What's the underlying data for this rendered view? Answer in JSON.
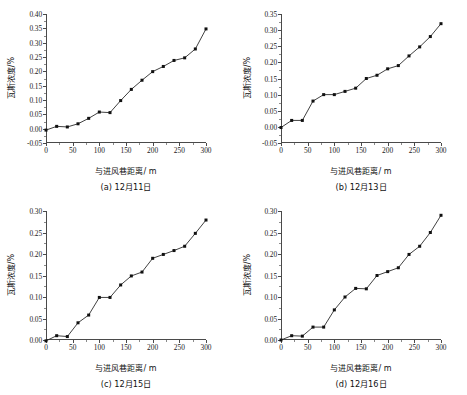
{
  "figure": {
    "background": "#ffffff",
    "marker_color": "#111111",
    "line_color": "#2b2b2b",
    "axis_color": "#4a4a4a",
    "layout": "2x2 grid of line charts"
  },
  "panels": [
    {
      "key": "a",
      "caption": "(a) 12月11日",
      "xlabel": "与进风巷距离/ m",
      "ylabel": "瓦斯浓度/%",
      "y_ticks": [
        "-0.05",
        "0.00",
        "0.05",
        "0.10",
        "0.15",
        "0.20",
        "0.25",
        "0.30",
        "0.35",
        "0.40"
      ],
      "x_ticks": [
        "0",
        "50",
        "100",
        "150",
        "200",
        "250",
        "300"
      ]
    },
    {
      "key": "b",
      "caption": "(b) 12月13日",
      "xlabel": "与进风巷距离/ m",
      "ylabel": "瓦斯浓度/%",
      "y_ticks": [
        "-0.05",
        "0.00",
        "0.05",
        "0.10",
        "0.15",
        "0.20",
        "0.25",
        "0.30",
        "0.35"
      ],
      "x_ticks": [
        "0",
        "50",
        "100",
        "150",
        "200",
        "250",
        "300"
      ]
    },
    {
      "key": "c",
      "caption": "(c) 12月15日",
      "xlabel": "与进风巷距离/ m",
      "ylabel": "瓦斯浓度/%",
      "y_ticks": [
        "0.00",
        "0.05",
        "0.10",
        "0.15",
        "0.20",
        "0.25",
        "0.30"
      ],
      "x_ticks": [
        "0",
        "50",
        "100",
        "150",
        "200",
        "250",
        "300"
      ]
    },
    {
      "key": "d",
      "caption": "(d) 12月16日",
      "xlabel": "与进风巷距离/ m",
      "ylabel": "瓦斯浓度/%",
      "y_ticks": [
        "0.00",
        "0.05",
        "0.10",
        "0.15",
        "0.20",
        "0.25",
        "0.30"
      ],
      "x_ticks": [
        "0",
        "50",
        "100",
        "150",
        "200",
        "250",
        "300"
      ]
    }
  ],
  "chart_data": [
    {
      "type": "line",
      "title": "(a) 12月11日",
      "xlabel": "与进风巷距离/ m",
      "ylabel": "瓦斯浓度/%",
      "xlim": [
        0,
        300
      ],
      "ylim": [
        -0.05,
        0.4
      ],
      "xticks": [
        0,
        50,
        100,
        150,
        200,
        250,
        300
      ],
      "yticks": [
        -0.05,
        0.0,
        0.05,
        0.1,
        0.15,
        0.2,
        0.25,
        0.3,
        0.35,
        0.4
      ],
      "grid": false,
      "legend": "none",
      "marker": "square",
      "x": [
        0,
        20,
        40,
        60,
        80,
        100,
        120,
        140,
        160,
        180,
        200,
        220,
        240,
        260,
        280,
        300
      ],
      "y": [
        -0.005,
        0.008,
        0.006,
        0.017,
        0.036,
        0.058,
        0.056,
        0.098,
        0.137,
        0.169,
        0.199,
        0.217,
        0.238,
        0.247,
        0.278,
        0.348
      ]
    },
    {
      "type": "line",
      "title": "(b) 12月13日",
      "xlabel": "与进风巷距离/ m",
      "ylabel": "瓦斯浓度/%",
      "xlim": [
        0,
        300
      ],
      "ylim": [
        -0.05,
        0.35
      ],
      "xticks": [
        0,
        50,
        100,
        150,
        200,
        250,
        300
      ],
      "yticks": [
        -0.05,
        0.0,
        0.05,
        0.1,
        0.15,
        0.2,
        0.25,
        0.3,
        0.35
      ],
      "grid": false,
      "legend": "none",
      "marker": "square",
      "x": [
        0,
        20,
        40,
        60,
        80,
        100,
        120,
        140,
        160,
        180,
        200,
        220,
        240,
        260,
        280,
        300
      ],
      "y": [
        -0.002,
        0.02,
        0.02,
        0.08,
        0.1,
        0.1,
        0.11,
        0.12,
        0.15,
        0.16,
        0.18,
        0.19,
        0.22,
        0.248,
        0.28,
        0.32
      ]
    },
    {
      "type": "line",
      "title": "(c) 12月15日",
      "xlabel": "与进风巷距离/ m",
      "ylabel": "瓦斯浓度/%",
      "xlim": [
        0,
        300
      ],
      "ylim": [
        0.0,
        0.3
      ],
      "xticks": [
        0,
        50,
        100,
        150,
        200,
        250,
        300
      ],
      "yticks": [
        0.0,
        0.05,
        0.1,
        0.15,
        0.2,
        0.25,
        0.3
      ],
      "grid": false,
      "legend": "none",
      "marker": "square",
      "x": [
        0,
        20,
        40,
        60,
        80,
        100,
        120,
        140,
        160,
        180,
        200,
        220,
        240,
        260,
        280,
        300
      ],
      "y": [
        -0.002,
        0.01,
        0.008,
        0.04,
        0.058,
        0.099,
        0.099,
        0.128,
        0.149,
        0.158,
        0.19,
        0.199,
        0.208,
        0.218,
        0.248,
        0.279
      ]
    },
    {
      "type": "line",
      "title": "(d) 12月16日",
      "xlabel": "与进风巷距离/ m",
      "ylabel": "瓦斯浓度/%",
      "xlim": [
        0,
        300
      ],
      "ylim": [
        0.0,
        0.3
      ],
      "xticks": [
        0,
        50,
        100,
        150,
        200,
        250,
        300
      ],
      "yticks": [
        0.0,
        0.05,
        0.1,
        0.15,
        0.2,
        0.25,
        0.3
      ],
      "grid": false,
      "legend": "none",
      "marker": "square",
      "x": [
        0,
        20,
        40,
        60,
        80,
        100,
        120,
        140,
        160,
        180,
        200,
        220,
        240,
        260,
        280,
        300
      ],
      "y": [
        0.0,
        0.01,
        0.009,
        0.03,
        0.03,
        0.07,
        0.1,
        0.12,
        0.119,
        0.15,
        0.159,
        0.168,
        0.199,
        0.218,
        0.25,
        0.29
      ]
    }
  ]
}
